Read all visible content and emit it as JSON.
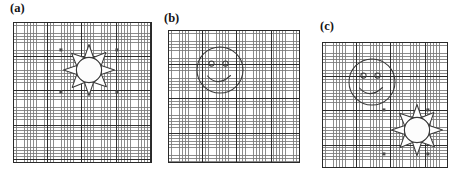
{
  "figure": {
    "background_color": "#ffffff",
    "width": 458,
    "height": 175,
    "grid": {
      "minor_cell_px": 2.85,
      "major_cell_px": 34.2,
      "minor_color": "#787878",
      "major_color": "#282828",
      "border_color": "#2a2a2a"
    },
    "glyph_colors": {
      "outline": "#3a3a3a",
      "fill": "#ffffff",
      "marker": "#4a4a4a"
    }
  },
  "panels": [
    {
      "id": "panel-a",
      "label": "(a)",
      "label_x": 10,
      "label_y": 2,
      "box": {
        "x": 13,
        "y": 22,
        "w": 139,
        "h": 141
      },
      "contents": [
        "sun"
      ],
      "sun": {
        "cx": 76,
        "cy": 48,
        "radius": 13,
        "rays": 8
      },
      "markers": [
        {
          "x": 48,
          "y": 28
        },
        {
          "x": 104,
          "y": 28
        },
        {
          "x": 48,
          "y": 70
        },
        {
          "x": 104,
          "y": 70
        }
      ]
    },
    {
      "id": "panel-b",
      "label": "(b)",
      "label_x": 164,
      "label_y": 12,
      "box": {
        "x": 168,
        "y": 30,
        "w": 132,
        "h": 133
      },
      "contents": [
        "smiley"
      ],
      "smiley": {
        "cx": 52,
        "cy": 40,
        "radius": 23
      },
      "markers": []
    },
    {
      "id": "panel-c",
      "label": "(c)",
      "label_x": 320,
      "label_y": 20,
      "box": {
        "x": 322,
        "y": 42,
        "w": 126,
        "h": 126
      },
      "contents": [
        "smiley",
        "sun"
      ],
      "smiley": {
        "cx": 50,
        "cy": 40,
        "radius": 23
      },
      "sun": {
        "cx": 95,
        "cy": 88,
        "radius": 13,
        "rays": 8
      },
      "markers": [
        {
          "x": 62,
          "y": 68
        },
        {
          "x": 106,
          "y": 68
        },
        {
          "x": 62,
          "y": 112
        },
        {
          "x": 106,
          "y": 112
        }
      ]
    }
  ]
}
